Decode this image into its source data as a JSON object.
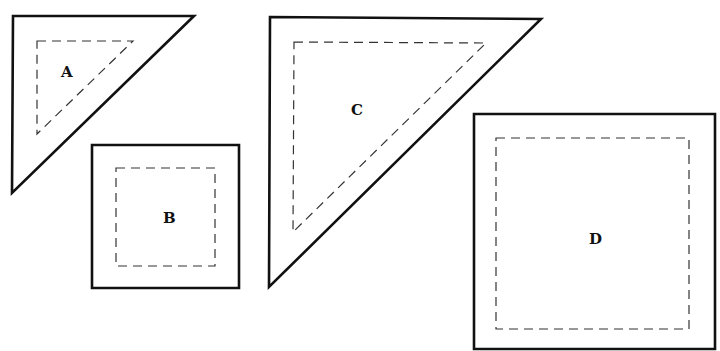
{
  "diagram": {
    "background": "#ffffff",
    "line_color": "#111111",
    "dash_color": "#333333",
    "shapes": [
      {
        "id": "A",
        "label": "A",
        "type": "right-triangle",
        "outer": "13,16 194,16 12,193",
        "inner": "37,41 133,41 37,134",
        "label_pos": [
          61,
          77
        ]
      },
      {
        "id": "B",
        "label": "B",
        "type": "square",
        "outer": "92,145 239,145 239,288 92,288",
        "inner": "116,168 215,168 215,266 116,266",
        "label_pos": [
          163,
          223
        ]
      },
      {
        "id": "C",
        "label": "C",
        "type": "right-triangle",
        "outer": "270,17 541,19 269,287",
        "inner": "294,42 486,43 293,232",
        "label_pos": [
          351,
          115
        ]
      },
      {
        "id": "D",
        "label": "D",
        "type": "square",
        "outer": "474,114 715,114 715,349 474,349",
        "inner": "496,138 689,138 689,329 496,329",
        "label_pos": [
          589,
          244
        ]
      }
    ]
  }
}
